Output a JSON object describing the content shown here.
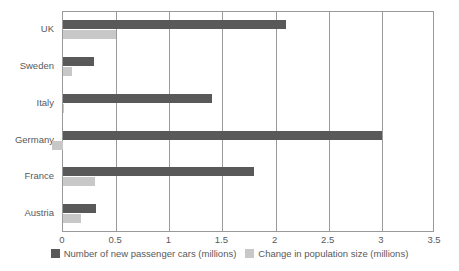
{
  "chart_data": {
    "type": "bar",
    "orientation": "horizontal",
    "title": "",
    "xlabel": "",
    "ylabel": "",
    "xlim": [
      0,
      3.5
    ],
    "xticks": [
      "0",
      "0.5",
      "1",
      "1.5",
      "2",
      "2.5",
      "3",
      "3.5"
    ],
    "xtick_values": [
      0,
      0.5,
      1,
      1.5,
      2,
      2.5,
      3,
      3.5
    ],
    "grid": true,
    "legend_position": "bottom",
    "categories": [
      "UK",
      "Sweden",
      "Italy",
      "Germany",
      "France",
      "Austria"
    ],
    "series": [
      {
        "name": "Number of new passenger cars (millions)",
        "color": "#595959",
        "values": [
          2.1,
          0.29,
          1.4,
          3.0,
          1.8,
          0.31
        ]
      },
      {
        "name": "Change in population size (millions)",
        "color": "#c8c8c8",
        "values": [
          0.5,
          0.08,
          0.01,
          -0.1,
          0.3,
          0.17
        ]
      }
    ]
  },
  "legend": {
    "items": [
      {
        "label": "Number of new passenger cars (millions)",
        "color": "#595959"
      },
      {
        "label": "Change in population size (millions)",
        "color": "#c8c8c8"
      }
    ]
  }
}
